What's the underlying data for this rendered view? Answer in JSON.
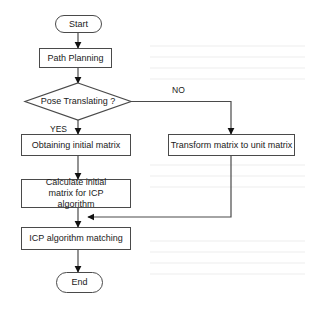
{
  "flowchart": {
    "nodes": {
      "start": {
        "label": "Start",
        "shape": "terminator"
      },
      "path_planning": {
        "label": "Path Planning",
        "shape": "process"
      },
      "decision": {
        "label": "Pose Translating ?",
        "shape": "decision"
      },
      "obtaining": {
        "label": "Obtaining initial matrix",
        "shape": "process"
      },
      "transform": {
        "label": "Transform matrix to unit matrix",
        "shape": "process"
      },
      "calculate": {
        "label": "Calculate initial matrix for ICP algorithm",
        "shape": "process"
      },
      "icp": {
        "label": "ICP algorithm matching",
        "shape": "process"
      },
      "end": {
        "label": "End",
        "shape": "terminator"
      }
    },
    "edge_labels": {
      "yes": "YES",
      "no": "NO"
    },
    "edges": [
      {
        "from": "start",
        "to": "path_planning"
      },
      {
        "from": "path_planning",
        "to": "decision"
      },
      {
        "from": "decision",
        "to": "obtaining",
        "label": "YES"
      },
      {
        "from": "decision",
        "to": "transform",
        "label": "NO"
      },
      {
        "from": "obtaining",
        "to": "calculate"
      },
      {
        "from": "calculate",
        "to": "icp"
      },
      {
        "from": "transform",
        "to": "icp"
      },
      {
        "from": "icp",
        "to": "end"
      }
    ],
    "colors": {
      "stroke": "#4a4a4a",
      "arrowhead": "#111111",
      "background": "#ffffff",
      "text": "#1a1a1a"
    }
  }
}
